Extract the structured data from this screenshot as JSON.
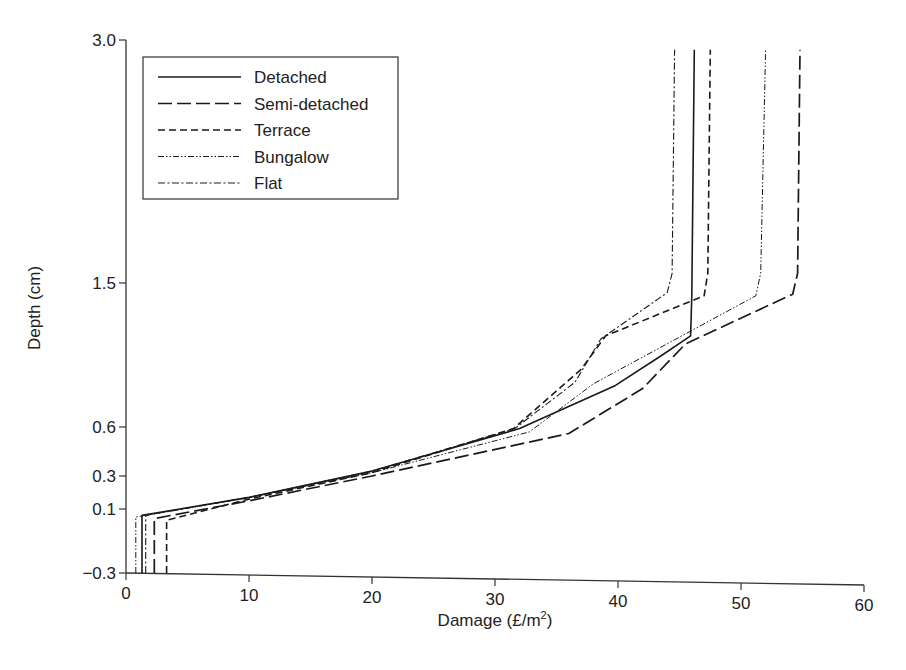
{
  "chart_data": {
    "type": "line",
    "title": "",
    "xlabel": "Damage (£/m²)",
    "ylabel": "Depth (cm)",
    "xlim": [
      0,
      60
    ],
    "ylim": [
      -0.3,
      3.0
    ],
    "x_ticks": [
      0,
      10,
      20,
      30,
      40,
      50,
      60
    ],
    "y_ticks": [
      -0.3,
      0.1,
      0.3,
      0.6,
      1.5,
      3.0
    ],
    "y_tick_labels": [
      "−0.3",
      "0.1",
      "0.3",
      "0.6",
      "1.5",
      "3.0"
    ],
    "y_scale_note": "non-uniform axis: ticks placed at unequal spacing",
    "grid": false,
    "legend_position": "upper-left",
    "series": [
      {
        "name": "Detached",
        "style": "solid",
        "points": [
          [
            1.3,
            -0.3
          ],
          [
            1.3,
            0.06
          ],
          [
            10,
            0.17
          ],
          [
            20,
            0.33
          ],
          [
            32,
            0.59
          ],
          [
            39.8,
            0.86
          ],
          [
            43.6,
            1.05
          ],
          [
            45.9,
            1.17
          ],
          [
            46.0,
            1.42
          ],
          [
            46.2,
            2.94
          ]
        ]
      },
      {
        "name": "Semi-detached",
        "style": "long-dash",
        "points": [
          [
            2.3,
            -0.3
          ],
          [
            2.3,
            0.04
          ],
          [
            10,
            0.15
          ],
          [
            20,
            0.3
          ],
          [
            36.0,
            0.56
          ],
          [
            42.0,
            0.84
          ],
          [
            45.5,
            1.12
          ],
          [
            54.2,
            1.43
          ],
          [
            54.6,
            1.56
          ],
          [
            54.8,
            2.94
          ]
        ]
      },
      {
        "name": "Terrace",
        "style": "dash",
        "points": [
          [
            3.3,
            -0.3
          ],
          [
            3.3,
            0.03
          ],
          [
            10,
            0.16
          ],
          [
            20,
            0.32
          ],
          [
            31.5,
            0.59
          ],
          [
            37.0,
            0.96
          ],
          [
            39.0,
            1.17
          ],
          [
            47.0,
            1.42
          ],
          [
            47.3,
            1.56
          ],
          [
            47.5,
            2.94
          ]
        ]
      },
      {
        "name": "Bungalow",
        "style": "dash-dot-dot",
        "points": [
          [
            0.8,
            -0.3
          ],
          [
            0.8,
            0.05
          ],
          [
            10,
            0.17
          ],
          [
            20,
            0.32
          ],
          [
            32.8,
            0.57
          ],
          [
            38.0,
            0.87
          ],
          [
            51.2,
            1.42
          ],
          [
            51.6,
            1.56
          ],
          [
            52.0,
            2.94
          ]
        ]
      },
      {
        "name": "Flat",
        "style": "dash-dot",
        "points": [
          [
            1.6,
            -0.3
          ],
          [
            1.6,
            0.06
          ],
          [
            10,
            0.17
          ],
          [
            20,
            0.33
          ],
          [
            31.6,
            0.59
          ],
          [
            36.5,
            0.88
          ],
          [
            38.6,
            1.15
          ],
          [
            44.0,
            1.44
          ],
          [
            44.4,
            1.56
          ],
          [
            44.6,
            2.94
          ]
        ]
      }
    ]
  },
  "legend": {
    "items": [
      {
        "label": "Detached"
      },
      {
        "label": "Semi-detached"
      },
      {
        "label": "Terrace"
      },
      {
        "label": "Bungalow"
      },
      {
        "label": "Flat"
      }
    ]
  },
  "axes": {
    "x_title": "Damage (£/m",
    "x_title_sup": "2",
    "x_title_end": ")",
    "y_title": "Depth (cm)"
  },
  "colors": {
    "line": "#1a1a1a",
    "axis": "#333333",
    "background": "#ffffff"
  }
}
